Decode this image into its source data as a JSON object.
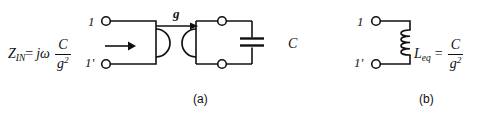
{
  "figure": {
    "background_color": "#ffffff",
    "line_color": "#111111",
    "width": 491,
    "height": 114
  },
  "panel_a": {
    "caption": "(a)",
    "input_impedance": {
      "symbol": "Z",
      "symbol_subscript": "IN",
      "equals": "=",
      "j_omega": "jω",
      "fraction_numerator": "C",
      "fraction_denominator_base": "g",
      "fraction_denominator_exponent": "2",
      "full_text": "Z_IN = jω C/g²"
    },
    "terminals": {
      "top_label": "1",
      "bottom_label": "1'"
    },
    "gyrator": {
      "conductance_label": "g",
      "arrow_direction": "right"
    },
    "capacitor": {
      "label": "C"
    }
  },
  "panel_b": {
    "caption": "(b)",
    "terminals": {
      "top_label": "1",
      "bottom_label": "1'"
    },
    "inductor": {
      "symbol": "L",
      "symbol_subscript": "eq",
      "equals": "=",
      "fraction_numerator": "C",
      "fraction_denominator_base": "g",
      "fraction_denominator_exponent": "2",
      "full_text": "L_eq = C/g²"
    }
  }
}
